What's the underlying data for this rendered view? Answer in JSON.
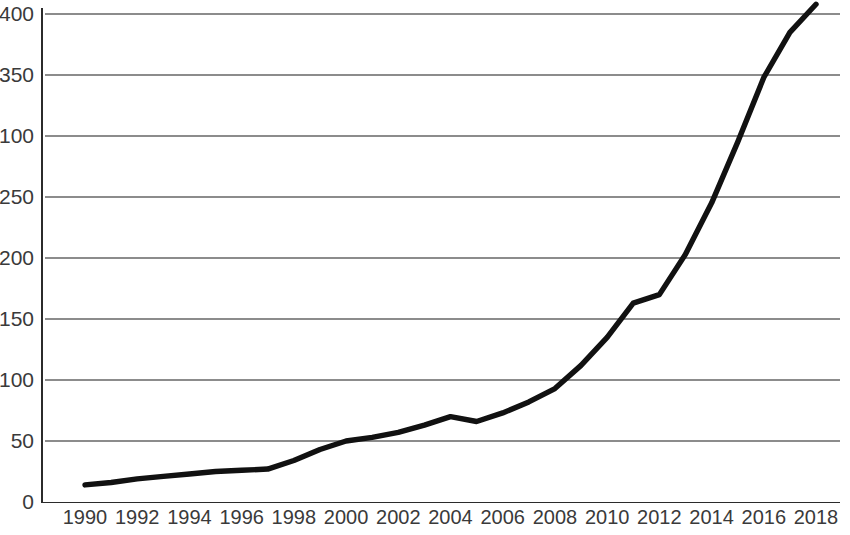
{
  "chart_data": {
    "type": "line",
    "title": "",
    "subtitle": "",
    "xlabel": "",
    "ylabel": "",
    "grid": true,
    "legend": null,
    "legend_position": "none",
    "line_color": "#111111",
    "grid_color": "#8c8c8c",
    "axis_color": "#2b2b2b",
    "xlim": [
      1990,
      2018
    ],
    "ylim": [
      0,
      400
    ],
    "y_tick_labels": [
      "0",
      "50",
      "100",
      "150",
      "200",
      "250",
      "100",
      "350",
      "400"
    ],
    "y_tick_values": [
      0,
      50,
      100,
      150,
      200,
      250,
      300,
      350,
      400
    ],
    "x_tick_labels": [
      "1990",
      "1992",
      "1994",
      "1996",
      "1998",
      "2000",
      "2002",
      "2004",
      "2006",
      "2008",
      "2010",
      "2012",
      "2014",
      "2016",
      "2018"
    ],
    "x_tick_values": [
      1990,
      1992,
      1994,
      1996,
      1998,
      2000,
      2002,
      2004,
      2006,
      2008,
      2010,
      2012,
      2014,
      2016,
      2018
    ],
    "x": [
      1990,
      1991,
      1992,
      1993,
      1994,
      1995,
      1996,
      1997,
      1998,
      1999,
      2000,
      2001,
      2002,
      2003,
      2004,
      2005,
      2006,
      2007,
      2008,
      2009,
      2010,
      2011,
      2012,
      2013,
      2014,
      2015,
      2016,
      2017,
      2018
    ],
    "values": [
      14,
      16,
      19,
      21,
      23,
      25,
      26,
      27,
      34,
      43,
      50,
      53,
      57,
      63,
      70,
      66,
      73,
      82,
      93,
      112,
      135,
      163,
      170,
      203,
      245,
      295,
      348,
      385,
      408
    ],
    "series": [
      {
        "name": "",
        "values": [
          14,
          16,
          19,
          21,
          23,
          25,
          26,
          27,
          34,
          43,
          50,
          53,
          57,
          63,
          70,
          66,
          73,
          82,
          93,
          112,
          135,
          163,
          170,
          203,
          245,
          295,
          348,
          385,
          408
        ]
      }
    ],
    "annotations": []
  },
  "plot_geometry": {
    "left": 45,
    "right": 840,
    "top": 14,
    "bottom": 502,
    "x_first": 85,
    "x_last": 816
  }
}
